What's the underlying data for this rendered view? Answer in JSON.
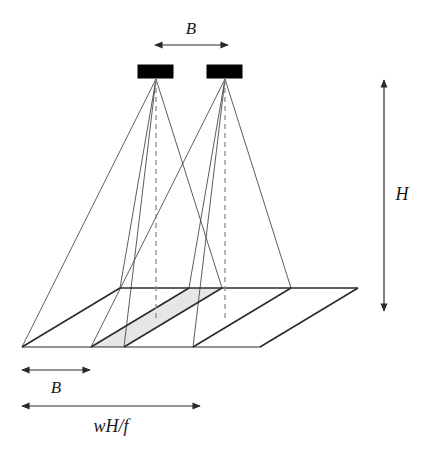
{
  "figure": {
    "type": "geometry-diagram",
    "background_color": "#ffffff",
    "line_color": "#2b2b2b",
    "thin_line_color": "#4a4a4a",
    "camera_fill": "#000000",
    "overlap_fill": "#e6e6e6",
    "dashed_color": "#8a8a8a"
  },
  "labels": {
    "baseline_top": "B",
    "baseline_bottom": "B",
    "height": "H",
    "footprint_width": "wH/f"
  },
  "dimensions": {
    "baseline_top_arrow": {
      "x1": 155,
      "x2": 228,
      "y": 45
    },
    "baseline_bottom_arrow": {
      "x1": 22,
      "x2": 90,
      "y": 370
    },
    "footprint_arrow": {
      "x1": 22,
      "x2": 200,
      "y": 406
    },
    "height_arrow": {
      "x": 384,
      "y1": 80,
      "y2": 311
    }
  },
  "cameras": [
    {
      "name": "left-camera",
      "x": 138,
      "y": 65,
      "width": 35,
      "height": 13,
      "apex_x": 156,
      "apex_y": 79
    },
    {
      "name": "right-camera",
      "x": 207,
      "y": 65,
      "width": 35,
      "height": 13,
      "apex_x": 225,
      "apex_y": 79
    }
  ],
  "ground": {
    "outline": [
      {
        "x": 120,
        "y": 288
      },
      {
        "x": 358,
        "y": 288
      },
      {
        "x": 260,
        "y": 347
      },
      {
        "x": 22,
        "y": 347
      }
    ],
    "left_footprint": [
      {
        "x": 120,
        "y": 288
      },
      {
        "x": 222,
        "y": 288
      },
      {
        "x": 124,
        "y": 347
      },
      {
        "x": 22,
        "y": 347
      }
    ],
    "right_footprint": [
      {
        "x": 189,
        "y": 288
      },
      {
        "x": 291,
        "y": 288
      },
      {
        "x": 193,
        "y": 347
      },
      {
        "x": 91,
        "y": 347
      }
    ],
    "overlap": [
      {
        "x": 189,
        "y": 288
      },
      {
        "x": 222,
        "y": 288
      },
      {
        "x": 124,
        "y": 347
      },
      {
        "x": 91,
        "y": 347
      }
    ]
  },
  "nadir_lines": [
    {
      "name": "left-nadir",
      "x": 156,
      "y1": 79,
      "y2": 318
    },
    {
      "name": "right-nadir",
      "x": 225,
      "y1": 79,
      "y2": 318
    }
  ]
}
